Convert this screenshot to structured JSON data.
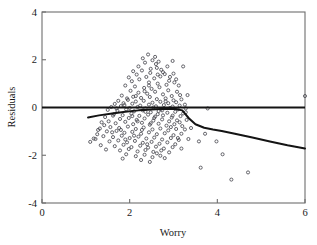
{
  "figure": {
    "name": "residuals-vs-worry-scatterplot",
    "background_color": "#ffffff",
    "frame_color": "#6e6e6e",
    "marker_color": "#4a4a52",
    "line_color": "#141414"
  },
  "chart_data": {
    "type": "scatter",
    "title": "",
    "xlabel": "Worry",
    "ylabel": "Residuals",
    "xlim": [
      0,
      6
    ],
    "ylim": [
      -4,
      4
    ],
    "xticks": [
      0,
      2,
      4,
      6
    ],
    "xtick_labels": [
      "0",
      "2",
      "4",
      "6"
    ],
    "yticks": [
      -4,
      -2,
      0,
      2,
      4
    ],
    "ytick_labels": [
      "-4",
      "-2",
      "0",
      "2",
      "4"
    ],
    "grid": false,
    "legend": null,
    "marker": "open-circle",
    "marker_size": 3.1,
    "reference_lines": [
      {
        "name": "zero-residual-line",
        "orientation": "horizontal",
        "y": 0,
        "x_start": 0,
        "x_end": 6,
        "width": 2.0
      }
    ],
    "series": [
      {
        "name": "lowess-smoother",
        "type": "line",
        "points": [
          [
            1.05,
            -0.42
          ],
          [
            1.3,
            -0.33
          ],
          [
            1.6,
            -0.25
          ],
          [
            1.9,
            -0.18
          ],
          [
            2.2,
            -0.12
          ],
          [
            2.5,
            -0.08
          ],
          [
            2.7,
            -0.06
          ],
          [
            2.9,
            -0.05
          ],
          [
            3.05,
            -0.06
          ],
          [
            3.2,
            -0.12
          ],
          [
            3.35,
            -0.45
          ],
          [
            3.5,
            -0.7
          ],
          [
            3.7,
            -0.85
          ],
          [
            3.9,
            -0.92
          ],
          [
            4.1,
            -0.98
          ],
          [
            4.4,
            -1.1
          ],
          [
            4.8,
            -1.26
          ],
          [
            5.2,
            -1.42
          ],
          [
            5.6,
            -1.58
          ],
          [
            6.0,
            -1.72
          ]
        ]
      },
      {
        "name": "residual-points",
        "type": "scatter",
        "n": 232,
        "points": [
          [
            2.42,
            2.22
          ],
          [
            2.52,
            1.98
          ],
          [
            2.35,
            1.88
          ],
          [
            2.6,
            1.82
          ],
          [
            2.98,
            1.95
          ],
          [
            3.22,
            1.72
          ],
          [
            2.72,
            1.58
          ],
          [
            2.28,
            1.55
          ],
          [
            2.62,
            1.66
          ],
          [
            2.47,
            1.45
          ],
          [
            2.16,
            1.38
          ],
          [
            2.8,
            1.4
          ],
          [
            2.38,
            1.28
          ],
          [
            2.56,
            1.22
          ],
          [
            2.7,
            1.3
          ],
          [
            2.9,
            1.12
          ],
          [
            2.05,
            1.1
          ],
          [
            2.22,
            1.18
          ],
          [
            2.44,
            1.05
          ],
          [
            2.64,
            1.0
          ],
          [
            2.84,
            0.95
          ],
          [
            3.02,
            1.05
          ],
          [
            1.9,
            0.92
          ],
          [
            2.12,
            0.88
          ],
          [
            2.33,
            0.82
          ],
          [
            2.5,
            0.78
          ],
          [
            2.68,
            0.85
          ],
          [
            2.88,
            0.72
          ],
          [
            3.08,
            0.66
          ],
          [
            2.02,
            0.7
          ],
          [
            2.2,
            0.62
          ],
          [
            2.4,
            0.58
          ],
          [
            2.58,
            0.66
          ],
          [
            2.76,
            0.55
          ],
          [
            2.96,
            0.48
          ],
          [
            3.15,
            0.52
          ],
          [
            1.82,
            0.5
          ],
          [
            2.08,
            0.45
          ],
          [
            2.26,
            0.4
          ],
          [
            2.46,
            0.44
          ],
          [
            2.62,
            0.35
          ],
          [
            2.82,
            0.38
          ],
          [
            3.0,
            0.3
          ],
          [
            3.18,
            0.34
          ],
          [
            1.74,
            0.28
          ],
          [
            1.96,
            0.32
          ],
          [
            2.14,
            0.25
          ],
          [
            2.32,
            0.28
          ],
          [
            2.52,
            0.2
          ],
          [
            2.7,
            0.24
          ],
          [
            2.88,
            0.18
          ],
          [
            3.06,
            0.22
          ],
          [
            3.26,
            0.12
          ],
          [
            1.66,
            0.15
          ],
          [
            1.88,
            0.1
          ],
          [
            2.06,
            0.16
          ],
          [
            2.24,
            0.08
          ],
          [
            2.44,
            0.12
          ],
          [
            2.6,
            0.05
          ],
          [
            2.78,
            0.1
          ],
          [
            2.98,
            0.04
          ],
          [
            3.14,
            0.08
          ],
          [
            1.58,
            0.02
          ],
          [
            1.8,
            0.06
          ],
          [
            2.0,
            -0.02
          ],
          [
            2.18,
            0.02
          ],
          [
            2.36,
            -0.04
          ],
          [
            2.54,
            0.0
          ],
          [
            2.72,
            -0.06
          ],
          [
            2.92,
            -0.02
          ],
          [
            3.1,
            -0.08
          ],
          [
            3.28,
            -0.04
          ],
          [
            1.5,
            -0.1
          ],
          [
            1.72,
            -0.14
          ],
          [
            1.92,
            -0.08
          ],
          [
            2.1,
            -0.16
          ],
          [
            2.3,
            -0.12
          ],
          [
            2.48,
            -0.2
          ],
          [
            2.66,
            -0.15
          ],
          [
            2.86,
            -0.22
          ],
          [
            3.04,
            -0.18
          ],
          [
            3.22,
            -0.25
          ],
          [
            1.64,
            -0.28
          ],
          [
            1.84,
            -0.32
          ],
          [
            2.04,
            -0.26
          ],
          [
            2.22,
            -0.35
          ],
          [
            2.42,
            -0.3
          ],
          [
            2.58,
            -0.38
          ],
          [
            2.76,
            -0.33
          ],
          [
            2.96,
            -0.42
          ],
          [
            3.16,
            -0.36
          ],
          [
            1.44,
            -0.4
          ],
          [
            1.78,
            -0.48
          ],
          [
            1.98,
            -0.44
          ],
          [
            2.16,
            -0.52
          ],
          [
            2.34,
            -0.46
          ],
          [
            2.54,
            -0.55
          ],
          [
            2.74,
            -0.5
          ],
          [
            2.9,
            -0.58
          ],
          [
            3.08,
            -0.54
          ],
          [
            1.36,
            -0.62
          ],
          [
            1.68,
            -0.66
          ],
          [
            1.9,
            -0.6
          ],
          [
            2.08,
            -0.7
          ],
          [
            2.28,
            -0.64
          ],
          [
            2.46,
            -0.72
          ],
          [
            2.66,
            -0.68
          ],
          [
            2.84,
            -0.76
          ],
          [
            3.02,
            -0.7
          ],
          [
            3.2,
            -0.78
          ],
          [
            1.56,
            -0.82
          ],
          [
            1.76,
            -0.86
          ],
          [
            1.96,
            -0.8
          ],
          [
            2.14,
            -0.9
          ],
          [
            2.32,
            -0.84
          ],
          [
            2.52,
            -0.92
          ],
          [
            2.7,
            -0.88
          ],
          [
            2.88,
            -0.96
          ],
          [
            3.06,
            -0.9
          ],
          [
            1.28,
            -0.94
          ],
          [
            1.48,
            -1.0
          ],
          [
            1.7,
            -0.98
          ],
          [
            1.88,
            -1.06
          ],
          [
            2.06,
            -1.02
          ],
          [
            2.26,
            -1.1
          ],
          [
            2.44,
            -1.04
          ],
          [
            2.62,
            -1.12
          ],
          [
            2.8,
            -1.08
          ],
          [
            3.0,
            -1.16
          ],
          [
            3.18,
            -1.1
          ],
          [
            1.4,
            -1.2
          ],
          [
            1.62,
            -1.24
          ],
          [
            1.82,
            -1.18
          ],
          [
            2.0,
            -1.28
          ],
          [
            2.2,
            -1.22
          ],
          [
            2.38,
            -1.3
          ],
          [
            2.56,
            -1.26
          ],
          [
            2.74,
            -1.34
          ],
          [
            2.94,
            -1.28
          ],
          [
            3.12,
            -1.36
          ],
          [
            1.22,
            -1.32
          ],
          [
            1.54,
            -1.42
          ],
          [
            1.74,
            -1.38
          ],
          [
            1.94,
            -1.46
          ],
          [
            2.12,
            -1.4
          ],
          [
            2.3,
            -1.48
          ],
          [
            2.5,
            -1.44
          ],
          [
            2.68,
            -1.52
          ],
          [
            2.86,
            -1.46
          ],
          [
            3.04,
            -1.54
          ],
          [
            1.34,
            -1.58
          ],
          [
            1.66,
            -1.62
          ],
          [
            1.86,
            -1.56
          ],
          [
            2.04,
            -1.66
          ],
          [
            2.24,
            -1.6
          ],
          [
            2.42,
            -1.68
          ],
          [
            2.6,
            -1.64
          ],
          [
            2.78,
            -1.72
          ],
          [
            2.98,
            -1.66
          ],
          [
            1.46,
            -1.76
          ],
          [
            1.78,
            -1.8
          ],
          [
            1.98,
            -1.74
          ],
          [
            2.18,
            -1.84
          ],
          [
            2.36,
            -1.78
          ],
          [
            2.54,
            -1.86
          ],
          [
            2.72,
            -1.8
          ],
          [
            2.9,
            -1.88
          ],
          [
            1.92,
            -1.96
          ],
          [
            2.14,
            -2.04
          ],
          [
            2.34,
            -1.98
          ],
          [
            2.52,
            -2.08
          ],
          [
            2.7,
            -2.02
          ],
          [
            1.84,
            -2.14
          ],
          [
            2.26,
            -2.2
          ],
          [
            2.46,
            -2.28
          ],
          [
            1.18,
            -1.3
          ],
          [
            1.1,
            -1.44
          ],
          [
            1.26,
            -1.12
          ],
          [
            3.32,
            0.52
          ],
          [
            3.3,
            -0.52
          ],
          [
            3.26,
            -0.92
          ],
          [
            3.34,
            -1.32
          ],
          [
            3.18,
            -1.72
          ],
          [
            3.28,
            -0.2
          ],
          [
            3.12,
            0.92
          ],
          [
            3.0,
            1.42
          ],
          [
            2.86,
            1.72
          ],
          [
            2.66,
            1.92
          ],
          [
            2.48,
            1.62
          ],
          [
            3.4,
            -0.86
          ],
          [
            3.58,
            -1.42
          ],
          [
            3.72,
            -1.1
          ],
          [
            3.62,
            -2.52
          ],
          [
            3.78,
            -0.04
          ],
          [
            4.32,
            -3.02
          ],
          [
            4.7,
            -2.72
          ],
          [
            4.12,
            -1.96
          ],
          [
            3.98,
            -1.42
          ],
          [
            6.0,
            0.48
          ],
          [
            2.3,
            2.06
          ],
          [
            2.58,
            2.12
          ],
          [
            2.2,
            1.72
          ],
          [
            2.08,
            1.52
          ],
          [
            1.98,
            1.26
          ],
          [
            2.92,
            1.28
          ],
          [
            3.06,
            1.18
          ],
          [
            2.76,
            1.48
          ],
          [
            2.64,
            1.38
          ],
          [
            2.44,
            0.92
          ],
          [
            2.34,
            0.68
          ],
          [
            2.14,
            0.48
          ],
          [
            1.94,
            0.38
          ],
          [
            1.86,
            0.18
          ],
          [
            1.7,
            -0.04
          ],
          [
            1.62,
            -0.34
          ],
          [
            1.52,
            -0.58
          ],
          [
            1.42,
            -0.74
          ],
          [
            1.32,
            -0.88
          ],
          [
            2.82,
            0.26
          ],
          [
            2.98,
            -0.34
          ],
          [
            3.14,
            -0.62
          ],
          [
            2.64,
            -0.28
          ],
          [
            2.48,
            -0.66
          ],
          [
            2.28,
            -0.94
          ],
          [
            2.1,
            -1.18
          ],
          [
            1.9,
            -1.34
          ],
          [
            2.4,
            -1.54
          ],
          [
            2.62,
            -1.92
          ],
          [
            2.8,
            -2.12
          ],
          [
            2.18,
            -0.58
          ],
          [
            2.36,
            -0.18
          ],
          [
            2.56,
            -0.44
          ],
          [
            2.74,
            -0.12
          ],
          [
            2.94,
            -0.82
          ],
          [
            3.1,
            -1.28
          ],
          [
            2.06,
            -0.36
          ],
          [
            1.8,
            -0.94
          ],
          [
            1.6,
            -1.04
          ]
        ]
      }
    ]
  },
  "axes": {
    "x_axis_name": "x-axis-worry",
    "y_axis_name": "y-axis-residuals"
  }
}
